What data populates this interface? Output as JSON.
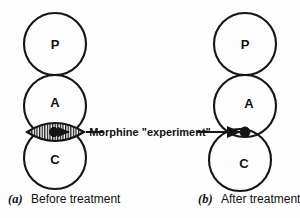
{
  "figure": {
    "colors": {
      "background": "#fdfdfd",
      "stroke": "#151515",
      "dot": "#141414",
      "hatch": "#151515"
    }
  },
  "panels": [
    {
      "id": "panel-a",
      "caption_index": "(a)",
      "caption_text": "Before treatment",
      "circles": [
        {
          "label": "P",
          "name": "circle-p"
        },
        {
          "label": "A",
          "name": "circle-a"
        },
        {
          "label": "C",
          "name": "circle-c"
        }
      ],
      "overlap_region": "hatched-lens",
      "dot": "present"
    },
    {
      "id": "panel-b",
      "caption_index": "(b)",
      "caption_text": "After treatment",
      "circles": [
        {
          "label": "P",
          "name": "circle-p"
        },
        {
          "label": "A",
          "name": "circle-a"
        },
        {
          "label": "C",
          "name": "circle-c"
        }
      ],
      "overlap_region": "none",
      "dot": "present"
    }
  ],
  "callout": {
    "label": "Morphine \"experiment\""
  }
}
